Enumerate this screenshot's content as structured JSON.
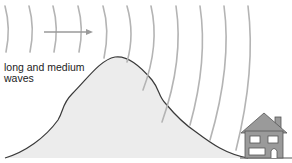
{
  "diagram": {
    "label": {
      "line1": "long and medium",
      "line2": "waves"
    },
    "colors": {
      "wave": "#b4b4b4",
      "arrow": "#9a9a9a",
      "mountain_fill": "#ececec",
      "mountain_outline": "#3a3a3a",
      "house_fill": "#9a9a9a",
      "house_outline": "#555555",
      "window": "#ffffff",
      "ground": "#555555",
      "text": "#222222"
    },
    "elements": [
      {
        "type": "wave-fronts",
        "count": 11,
        "direction": "right"
      },
      {
        "type": "arrow",
        "direction": "right"
      },
      {
        "type": "hill"
      },
      {
        "type": "house"
      }
    ]
  }
}
